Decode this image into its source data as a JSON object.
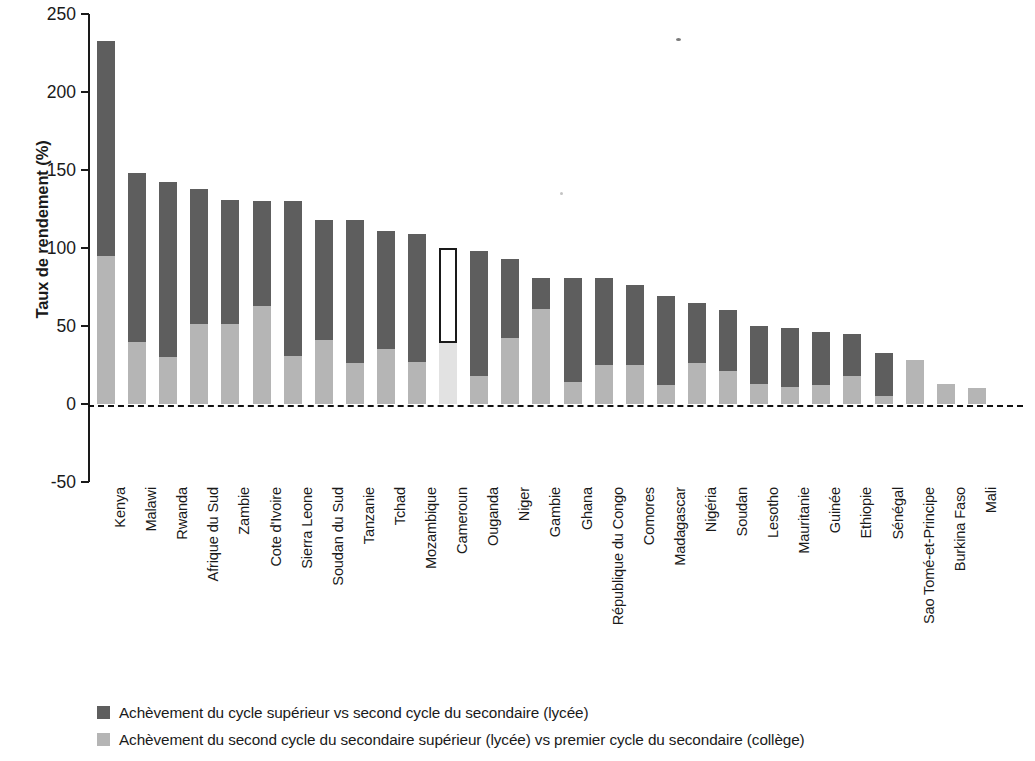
{
  "chart_data": {
    "type": "bar",
    "subtype": "stacked-bar",
    "title": "",
    "subtitle": "",
    "xlabel": "",
    "ylabel": "Taux de rendement (%)",
    "ylim": [
      -50,
      250
    ],
    "yticks": [
      -50,
      0,
      50,
      100,
      150,
      200,
      250
    ],
    "ytick_labels": [
      "-50",
      "0",
      "50",
      "100",
      "150",
      "200",
      "250"
    ],
    "grid": false,
    "legend_position": "bottom-left",
    "baseline": 0,
    "baseline_style": "dashed",
    "highlighted_category": "Cameroun",
    "highlight_style": "outlined-bar",
    "colors": {
      "upper_segment": "#5e5e5e",
      "lower_segment": "#b5b5b5",
      "highlight_outline": "#1a1a1a",
      "axis": "#1a1a1a",
      "background": "#ffffff"
    },
    "categories": [
      "Kenya",
      "Malawi",
      "Rwanda",
      "Afrique du Sud",
      "Zambie",
      "Cote d'Ivoire",
      "Sierra Leone",
      "Soudan du Sud",
      "Tanzanie",
      "Tchad",
      "Mozambique",
      "Cameroun",
      "Ouganda",
      "Niger",
      "Gambie",
      "Ghana",
      "République du Congo",
      "Comores",
      "Madagascar",
      "Nigéria",
      "Soudan",
      "Lesotho",
      "Mauritanie",
      "Guinée",
      "Ethiopie",
      "Sénégal",
      "Sao Tomé-et-Principe",
      "Burkina Faso",
      "Mali"
    ],
    "series": [
      {
        "name": "Achèvement du second cycle du secondaire supérieur (lycée) vs premier cycle du secondaire (collège)",
        "key": "lower",
        "color": "#b5b5b5",
        "values": [
          95,
          40,
          30,
          51,
          51,
          63,
          31,
          41,
          26,
          35,
          27,
          39,
          18,
          42,
          61,
          14,
          25,
          25,
          12,
          26,
          21,
          13,
          11,
          12,
          18,
          5,
          28,
          13,
          10
        ]
      },
      {
        "name": "Achèvement du cycle supérieur vs second cycle du secondaire (lycée)",
        "key": "upper",
        "color": "#5e5e5e",
        "values": [
          138,
          108,
          112,
          87,
          80,
          67,
          99,
          77,
          92,
          76,
          82,
          61,
          80,
          51,
          20,
          67,
          56,
          51,
          57,
          39,
          39,
          37,
          38,
          34,
          27,
          28,
          0,
          0,
          0
        ]
      }
    ],
    "totals": [
      233,
      148,
      142,
      138,
      131,
      130,
      130,
      118,
      118,
      111,
      109,
      100,
      98,
      93,
      81,
      81,
      81,
      76,
      69,
      65,
      60,
      50,
      49,
      46,
      45,
      33,
      28,
      13,
      10
    ]
  },
  "legend": {
    "items": [
      {
        "swatch_color": "#5e5e5e",
        "label": "Achèvement du cycle supérieur vs second cycle du secondaire (lycée)"
      },
      {
        "swatch_color": "#b5b5b5",
        "label": "Achèvement du second cycle du secondaire supérieur (lycée) vs premier cycle du secondaire (collège)"
      }
    ]
  }
}
